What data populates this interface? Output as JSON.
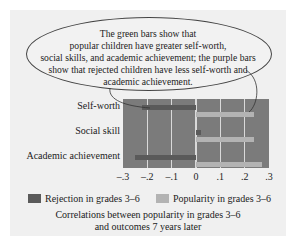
{
  "annotation": {
    "lines": [
      "The green bars show that",
      "popular children have greater self-worth,",
      "social skills, and academic achievement; the purple bars",
      "show that rejected children have less self-worth and",
      "academic achievement."
    ]
  },
  "legend": {
    "rejection": "Rejection in grades 3–6",
    "popularity": "Popularity in grades 3–6"
  },
  "caption": {
    "line1": "Correlations between popularity in grades 3–6",
    "line2": "and outcomes 7 years later"
  },
  "colors": {
    "rejection": "#5a5a5a",
    "popularity": "#b3b3b3",
    "plot_bg": "#7b7b7b",
    "gridline": "#d9d9d9"
  },
  "chart_data": {
    "type": "bar",
    "orientation": "horizontal",
    "title": "Correlations between popularity in grades 3–6 and outcomes 7 years later",
    "categories": [
      "Self-worth",
      "Social skill",
      "Academic achievement"
    ],
    "series": [
      {
        "name": "Rejection in grades 3–6",
        "values": [
          -0.22,
          0.02,
          -0.25
        ]
      },
      {
        "name": "Popularity in grades 3–6",
        "values": [
          0.24,
          0.24,
          0.27
        ]
      }
    ],
    "xlabel": "",
    "ylabel": "",
    "xlim": [
      -0.3,
      0.3
    ],
    "xticks": [
      "–.3",
      "–.2",
      "–.1",
      "0",
      ".1",
      ".2",
      ".3"
    ],
    "grid": true,
    "legend_position": "bottom"
  }
}
